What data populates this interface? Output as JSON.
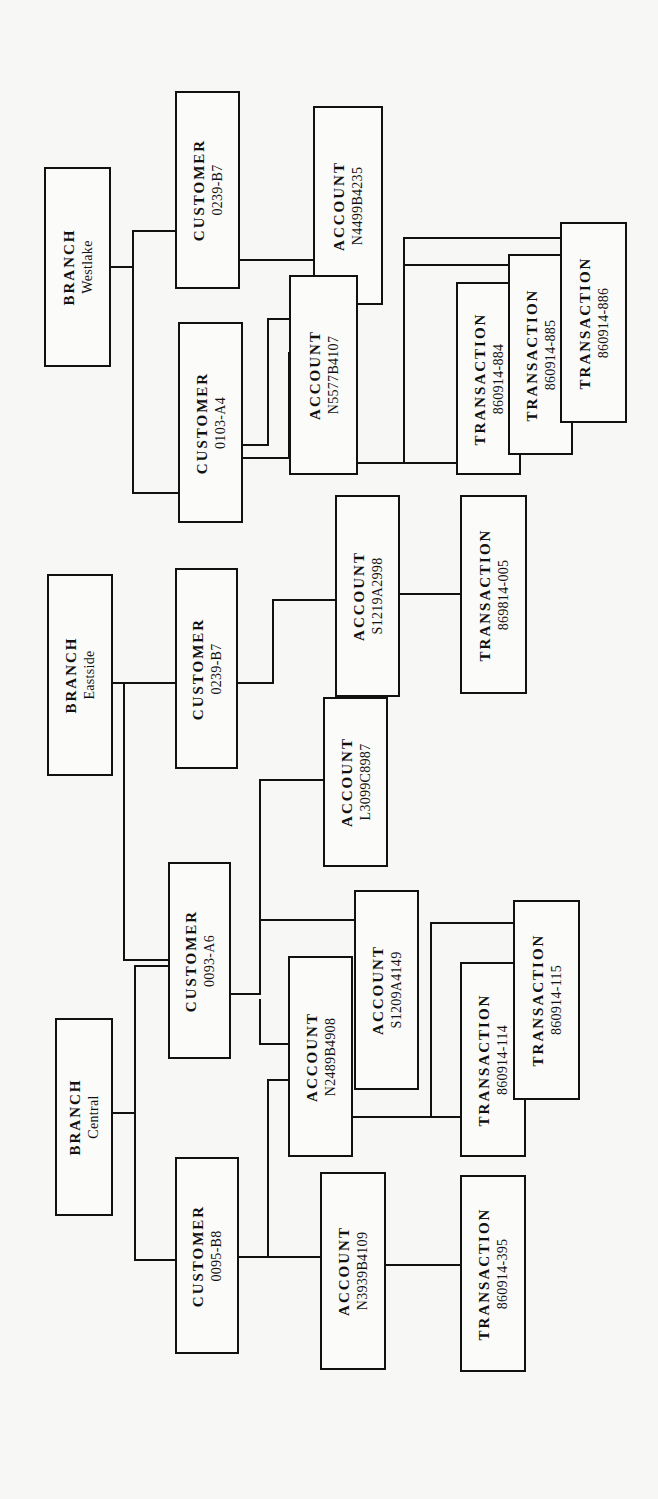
{
  "diagram": {
    "orientation": "rotated -90deg",
    "line_color": "#111111",
    "box_fill": "#fbfbfa",
    "background": "#f7f7f6",
    "nodes": [
      {
        "id": "b_west",
        "type": "BRANCH",
        "ident": "Westlake",
        "x": 44,
        "y": 167,
        "w": 67,
        "h": 200
      },
      {
        "id": "c_west1",
        "type": "CUSTOMER",
        "ident": "0239-B7",
        "x": 175,
        "y": 91,
        "w": 65,
        "h": 198
      },
      {
        "id": "c_west2",
        "type": "CUSTOMER",
        "ident": "0103-A4",
        "x": 178,
        "y": 322,
        "w": 65,
        "h": 201
      },
      {
        "id": "a_west1",
        "type": "ACCOUNT",
        "ident": "N4499B4235",
        "x": 313,
        "y": 106,
        "w": 70,
        "h": 199
      },
      {
        "id": "a_west2",
        "type": "ACCOUNT",
        "ident": "N5577B4107",
        "x": 289,
        "y": 275,
        "w": 69,
        "h": 200
      },
      {
        "id": "t_884",
        "type": "TRANSACTION",
        "ident": "860914-884",
        "x": 456,
        "y": 282,
        "w": 65,
        "h": 193
      },
      {
        "id": "t_885",
        "type": "TRANSACTION",
        "ident": "860914-885",
        "x": 508,
        "y": 254,
        "w": 65,
        "h": 201
      },
      {
        "id": "t_886",
        "type": "TRANSACTION",
        "ident": "860914-886",
        "x": 560,
        "y": 222,
        "w": 67,
        "h": 201
      },
      {
        "id": "b_east",
        "type": "BRANCH",
        "ident": "Eastside",
        "x": 47,
        "y": 574,
        "w": 66,
        "h": 202
      },
      {
        "id": "c_east1",
        "type": "CUSTOMER",
        "ident": "0239-B7",
        "x": 175,
        "y": 568,
        "w": 63,
        "h": 201
      },
      {
        "id": "a_east2",
        "type": "ACCOUNT",
        "ident": "L3099C8987",
        "x": 323,
        "y": 697,
        "w": 65,
        "h": 170
      },
      {
        "id": "a_east1",
        "type": "ACCOUNT",
        "ident": "S1219A2998",
        "x": 335,
        "y": 495,
        "w": 65,
        "h": 202
      },
      {
        "id": "t_005",
        "type": "TRANSACTION",
        "ident": "869814-005",
        "x": 460,
        "y": 495,
        "w": 67,
        "h": 199
      },
      {
        "id": "b_cent",
        "type": "BRANCH",
        "ident": "Central",
        "x": 55,
        "y": 1018,
        "w": 58,
        "h": 198
      },
      {
        "id": "c_cent1",
        "type": "CUSTOMER",
        "ident": "0093-A6",
        "x": 168,
        "y": 862,
        "w": 63,
        "h": 197
      },
      {
        "id": "c_cent2",
        "type": "CUSTOMER",
        "ident": "0095-B8",
        "x": 175,
        "y": 1157,
        "w": 64,
        "h": 197
      },
      {
        "id": "a_cent2",
        "type": "ACCOUNT",
        "ident": "S1209A4149",
        "x": 354,
        "y": 890,
        "w": 65,
        "h": 200
      },
      {
        "id": "a_cent1",
        "type": "ACCOUNT",
        "ident": "N2489B4908",
        "x": 288,
        "y": 956,
        "w": 65,
        "h": 201
      },
      {
        "id": "a_cent3",
        "type": "ACCOUNT",
        "ident": "N3939B4109",
        "x": 320,
        "y": 1172,
        "w": 66,
        "h": 198
      },
      {
        "id": "t_114",
        "type": "TRANSACTION",
        "ident": "860914-114",
        "x": 460,
        "y": 962,
        "w": 66,
        "h": 195
      },
      {
        "id": "t_115",
        "type": "TRANSACTION",
        "ident": "860914-115",
        "x": 513,
        "y": 900,
        "w": 67,
        "h": 200
      },
      {
        "id": "t_395",
        "type": "TRANSACTION",
        "ident": "860914-395",
        "x": 460,
        "y": 1175,
        "w": 66,
        "h": 197
      }
    ],
    "edges": [
      {
        "from": "b_west",
        "to": "c_west1"
      },
      {
        "from": "b_west",
        "to": "c_west2"
      },
      {
        "from": "c_west1",
        "to": "a_west1"
      },
      {
        "from": "c_west2",
        "to": "a_west1"
      },
      {
        "from": "c_west2",
        "to": "a_west2"
      },
      {
        "from": "a_west2",
        "to": "t_884"
      },
      {
        "from": "a_west2",
        "to": "t_885"
      },
      {
        "from": "a_west2",
        "to": "t_886"
      },
      {
        "from": "b_east",
        "to": "c_east1"
      },
      {
        "from": "b_east",
        "to": "c_cent1"
      },
      {
        "from": "c_east1",
        "to": "a_east1"
      },
      {
        "from": "c_cent1",
        "to": "a_east1"
      },
      {
        "from": "c_cent1",
        "to": "a_east2"
      },
      {
        "from": "a_east1",
        "to": "t_005"
      },
      {
        "from": "b_cent",
        "to": "c_cent1"
      },
      {
        "from": "b_cent",
        "to": "c_cent2"
      },
      {
        "from": "c_cent1",
        "to": "a_cent1"
      },
      {
        "from": "c_cent1",
        "to": "a_cent2"
      },
      {
        "from": "c_cent2",
        "to": "a_cent1"
      },
      {
        "from": "c_cent2",
        "to": "a_cent3"
      },
      {
        "from": "a_cent1",
        "to": "t_114"
      },
      {
        "from": "a_cent1",
        "to": "t_115"
      },
      {
        "from": "a_cent3",
        "to": "t_395"
      }
    ],
    "segments": [
      [
        110,
        267,
        133,
        267
      ],
      [
        133,
        231,
        133,
        493
      ],
      [
        133,
        231,
        175,
        231
      ],
      [
        133,
        493,
        178,
        493
      ],
      [
        239,
        260,
        313,
        260
      ],
      [
        242,
        445,
        268,
        445
      ],
      [
        268,
        319,
        268,
        445
      ],
      [
        268,
        319,
        313,
        319
      ],
      [
        242,
        458,
        289,
        458
      ],
      [
        289,
        353,
        289,
        458
      ],
      [
        289,
        353,
        313,
        353
      ],
      [
        357,
        463,
        456,
        463
      ],
      [
        404,
        238,
        404,
        463
      ],
      [
        404,
        238,
        560,
        238
      ],
      [
        404,
        265,
        508,
        265
      ],
      [
        113,
        683,
        124,
        683
      ],
      [
        124,
        683,
        175,
        683
      ],
      [
        124,
        683,
        124,
        960
      ],
      [
        124,
        960,
        168,
        960
      ],
      [
        237,
        683,
        273,
        683
      ],
      [
        273,
        600,
        273,
        683
      ],
      [
        273,
        600,
        335,
        600
      ],
      [
        230,
        994,
        260,
        994
      ],
      [
        260,
        780,
        260,
        994
      ],
      [
        260,
        780,
        323,
        780
      ],
      [
        260,
        920,
        354,
        920
      ],
      [
        399,
        594,
        460,
        594
      ],
      [
        112,
        1113,
        135,
        1113
      ],
      [
        135,
        966,
        135,
        1260
      ],
      [
        135,
        966,
        168,
        966
      ],
      [
        135,
        1260,
        175,
        1260
      ],
      [
        260,
        1000,
        260,
        1044
      ],
      [
        260,
        1044,
        288,
        1044
      ],
      [
        238,
        1257,
        268,
        1257
      ],
      [
        268,
        1080,
        268,
        1257
      ],
      [
        268,
        1080,
        288,
        1080
      ],
      [
        268,
        1257,
        320,
        1257
      ],
      [
        352,
        1117,
        460,
        1117
      ],
      [
        431,
        923,
        431,
        1117
      ],
      [
        431,
        923,
        513,
        923
      ],
      [
        385,
        1265,
        460,
        1265
      ]
    ]
  }
}
